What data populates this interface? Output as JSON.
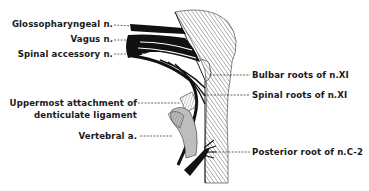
{
  "figure": {
    "type": "anatomical-illustration",
    "labels_left": [
      {
        "id": "glossopharyngeal",
        "text": "Glossopharyngeal n."
      },
      {
        "id": "vagus",
        "text": "Vagus n."
      },
      {
        "id": "spinal-accessory",
        "text": "Spinal accessory n."
      },
      {
        "id": "uppermost-attachment-line1",
        "text": "Uppermost attachment of"
      },
      {
        "id": "uppermost-attachment-line2",
        "text": "denticulate ligament"
      },
      {
        "id": "vertebral",
        "text": "Vertebral a."
      }
    ],
    "labels_right": [
      {
        "id": "bulbar-roots",
        "text": "Bulbar roots of n.XI"
      },
      {
        "id": "spinal-roots",
        "text": "Spinal roots of n.XI"
      },
      {
        "id": "posterior-root",
        "text": "Posterior root of n.C-2"
      }
    ],
    "colors": {
      "ink": "#1a1a1a",
      "hatch": "#555555",
      "background": "#ffffff",
      "gray_fill": "#bdbdbd"
    }
  }
}
